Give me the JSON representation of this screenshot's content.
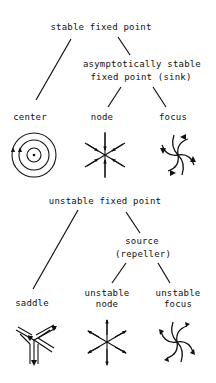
{
  "diagram": {
    "stable": {
      "root": "stable fixed point",
      "sink_line1": "asymptotically stable",
      "sink_line2": "fixed point (sink)",
      "leaves": [
        {
          "label": "center",
          "icon": "center-icon"
        },
        {
          "label": "node",
          "icon": "stable-node-icon"
        },
        {
          "label": "focus",
          "icon": "stable-focus-icon"
        }
      ]
    },
    "unstable": {
      "root": "unstable fixed point",
      "source_line1": "source",
      "source_line2": "(repeller)",
      "leaves": [
        {
          "label": "saddle",
          "icon": "saddle-icon"
        },
        {
          "label_line1": "unstable",
          "label_line2": "node",
          "icon": "unstable-node-icon"
        },
        {
          "label_line1": "unstable",
          "label_line2": "focus",
          "icon": "unstable-focus-icon"
        }
      ]
    }
  },
  "colors": {
    "ink": "#111111",
    "background": "#ffffff"
  }
}
